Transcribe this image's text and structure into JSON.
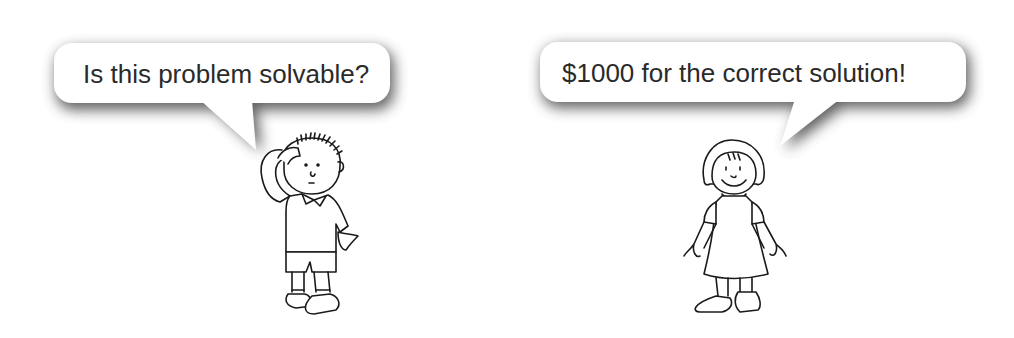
{
  "scene": {
    "description": "Cartoon of a boy and a girl with speech bubbles",
    "characters": [
      {
        "name": "boy",
        "pose": "scratching head, puzzled",
        "speech": "Is this problem solvable?"
      },
      {
        "name": "girl",
        "pose": "smiling, arms down",
        "speech": "$1000 for the correct solution!"
      }
    ]
  },
  "colors": {
    "background": "#ffffff",
    "line": "#1a1a1a",
    "bubble_fill": "#ffffff",
    "shadow": "#555555",
    "text": "#2a2a2a"
  }
}
